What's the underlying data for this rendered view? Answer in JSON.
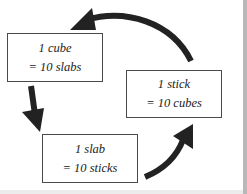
{
  "diagram": {
    "type": "cycle",
    "colors": {
      "arrow": "#222222",
      "box_border": "#4a4a4a",
      "text": "#222222"
    },
    "nodes": [
      {
        "id": "cube",
        "line1": "1 cube",
        "line2": "= 10 slabs"
      },
      {
        "id": "stick",
        "line1": "1 stick",
        "line2": "= 10 cubes"
      },
      {
        "id": "slab",
        "line1": "1 slab",
        "line2": "= 10 sticks"
      }
    ],
    "edges": [
      {
        "from": "stick",
        "to": "cube",
        "icon": "curved-arrow-icon"
      },
      {
        "from": "cube",
        "to": "slab",
        "icon": "down-arrow-icon"
      },
      {
        "from": "slab",
        "to": "stick",
        "icon": "curved-arrow-icon"
      }
    ]
  }
}
